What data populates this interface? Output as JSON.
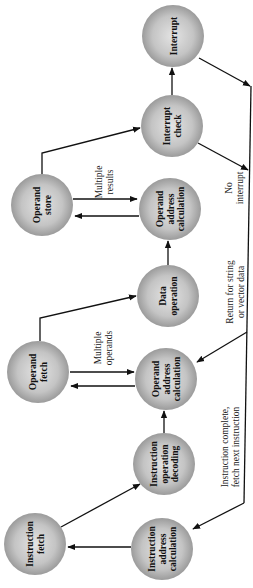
{
  "diagram": {
    "orientation": "rotated-90-ccw",
    "node_fill_center": "#e2e2e2",
    "node_fill_edge": "#8f8f8f",
    "line_color": "#111111",
    "nodes": [
      {
        "id": "interrupt",
        "lines": [
          "Interrupt"
        ],
        "cx": 173,
        "cy": 36
      },
      {
        "id": "interrupt-check",
        "lines": [
          "Interrupt",
          "check"
        ],
        "cx": 172,
        "cy": 126
      },
      {
        "id": "operand-store",
        "lines": [
          "Operand",
          "store"
        ],
        "cx": 42,
        "cy": 205
      },
      {
        "id": "operand-address-calculation-store",
        "lines": [
          "Operand",
          "address",
          "calculation"
        ],
        "cx": 170,
        "cy": 209
      },
      {
        "id": "data-operation",
        "lines": [
          "Data",
          "operation"
        ],
        "cx": 168,
        "cy": 296
      },
      {
        "id": "operand-fetch",
        "lines": [
          "Operand",
          "fetch"
        ],
        "cx": 38,
        "cy": 372
      },
      {
        "id": "operand-address-calculation-fetch",
        "lines": [
          "Operand",
          "address",
          "calculation"
        ],
        "cx": 166,
        "cy": 379
      },
      {
        "id": "instruction-operation-decoding",
        "lines": [
          "Instruction",
          "operation",
          "decoding"
        ],
        "cx": 164,
        "cy": 464
      },
      {
        "id": "instruction-fetch",
        "lines": [
          "Instruction",
          "fetch"
        ],
        "cx": 35,
        "cy": 544
      },
      {
        "id": "instruction-address-calculation",
        "lines": [
          "Instruction",
          "address",
          "calculation"
        ],
        "cx": 162,
        "cy": 549
      }
    ],
    "edge_labels": [
      {
        "id": "multiple-results",
        "lines": [
          "Multiple",
          "results"
        ],
        "x": 102,
        "y": 182
      },
      {
        "id": "no-interrupt",
        "lines": [
          "No",
          "interrupt"
        ],
        "x": 232,
        "y": 188
      },
      {
        "id": "return-string-vector",
        "lines": [
          "Return for string",
          "or vector data"
        ],
        "x": 233,
        "y": 292
      },
      {
        "id": "multiple-operands",
        "lines": [
          "Multiple",
          "operands"
        ],
        "x": 101,
        "y": 348
      },
      {
        "id": "instruction-complete",
        "lines": [
          "Instruction complete,",
          "fetch next instruction"
        ],
        "x": 228,
        "y": 447
      }
    ]
  }
}
